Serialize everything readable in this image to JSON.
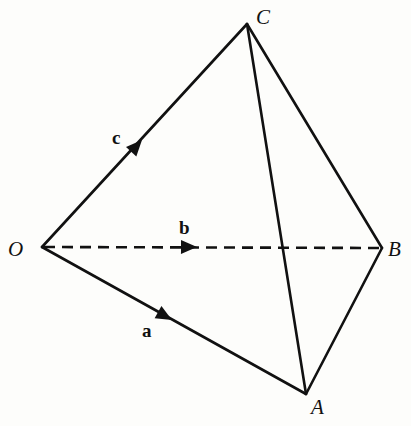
{
  "diagram": {
    "points": {
      "O": {
        "label": "O",
        "x": 42,
        "y": 247
      },
      "A": {
        "label": "A",
        "x": 306,
        "y": 394
      },
      "B": {
        "label": "B",
        "x": 382,
        "y": 248
      },
      "C": {
        "label": "C",
        "x": 247,
        "y": 24
      }
    },
    "vectors": {
      "a": {
        "label": "a",
        "from": "O",
        "to": "A"
      },
      "b": {
        "label": "b",
        "from": "O",
        "to": "B",
        "style": "dashed"
      },
      "c": {
        "label": "c",
        "from": "O",
        "to": "C"
      }
    },
    "edges": [
      {
        "from": "O",
        "to": "C",
        "style": "solid"
      },
      {
        "from": "O",
        "to": "A",
        "style": "solid"
      },
      {
        "from": "O",
        "to": "B",
        "style": "dashed"
      },
      {
        "from": "C",
        "to": "A",
        "style": "solid"
      },
      {
        "from": "C",
        "to": "B",
        "style": "solid"
      },
      {
        "from": "A",
        "to": "B",
        "style": "solid"
      }
    ],
    "colors": {
      "line": "#111111",
      "background": "#fdfdfb"
    }
  }
}
